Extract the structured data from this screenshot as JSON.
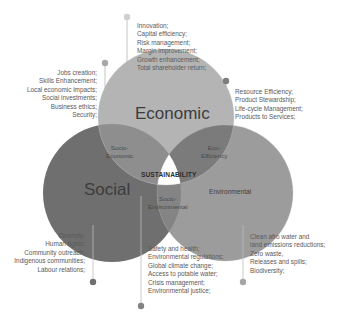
{
  "diagram": {
    "circles": [
      {
        "id": "economic",
        "label": "Economic",
        "color": "#a9a9a9"
      },
      {
        "id": "social",
        "label": "Social",
        "color": "#707070"
      },
      {
        "id": "environmental",
        "label": "Environmental",
        "color": "#9a9a9a"
      }
    ],
    "overlaps": {
      "socio_economic": "Socio-\nEconomic",
      "socio_economic_line1": "Socio-",
      "socio_economic_line2": "Economic",
      "eco_efficiency_line1": "Eco-",
      "eco_efficiency_line2": "Efficiency",
      "socio_environmental_line1": "Socio-",
      "socio_environmental_line2": "Environmental",
      "center": "SUSTAINABILITY"
    },
    "annotations": {
      "economic": {
        "items": [
          "Innovation;",
          "Capital efficiency;",
          "Risk management;",
          "Margin improvement;",
          "Growth enhancement;",
          "Total shareholder return;"
        ]
      },
      "socio_economic": {
        "items": [
          "Jobs creation;",
          "Skills Enhancement;",
          "Local economic impacts;",
          "Social investments;",
          "Business ethics;",
          "Security;"
        ]
      },
      "eco_efficiency": {
        "items": [
          "Resource Efficiency;",
          "Product Stewardship;",
          "Life-cycle Management;",
          "Products to Services;"
        ]
      },
      "social": {
        "items": [
          "Diversity;",
          "Human rights;",
          "Community outreach;",
          "Indigenous communities;",
          "Labour relations;"
        ]
      },
      "socio_environmental": {
        "items": [
          "Safety and health;",
          "Environmental regulations;",
          "Global climate change;",
          "Access to potable water;",
          "Crisis management;",
          "Environmental justice;"
        ]
      },
      "environmental": {
        "items": [
          "Clean afro water and",
          "land emissions reductions;",
          "Zero waste,",
          "Releases and spills;",
          "Biodiversity;"
        ]
      }
    },
    "colors": {
      "economic_fill": "#b3b3b3",
      "social_fill": "#6e6e6e",
      "environmental_fill": "#9b9b9b",
      "socio_economic_fill": "#8c8c8c",
      "eco_efficiency_fill": "#7a7a7a",
      "socio_environmental_fill": "#828282",
      "center_fill": "#ffffff",
      "leader_line": "#b0b0b0",
      "dot_light": "#c4c4c4",
      "dot_dark": "#7d7d7d"
    }
  }
}
